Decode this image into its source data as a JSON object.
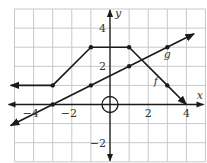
{
  "chart_data": {
    "type": "line",
    "title": "",
    "xlabel": "x",
    "ylabel": "y",
    "xlim": [
      -5,
      5
    ],
    "ylim": [
      -3,
      5
    ],
    "grid": true,
    "grid_step": 1,
    "x_ticks": [
      {
        "value": -4,
        "label": "−4"
      },
      {
        "value": -2,
        "label": "−2"
      },
      {
        "value": 2,
        "label": "2"
      },
      {
        "value": 4,
        "label": "4"
      }
    ],
    "y_ticks": [
      {
        "value": 4,
        "label": "4"
      },
      {
        "value": 2,
        "label": "2"
      },
      {
        "value": -2,
        "label": "−2"
      }
    ],
    "origin_marker": "circle",
    "series": [
      {
        "name": "f",
        "label": "f",
        "kind": "piecewise-linear",
        "points": [
          [
            -5.2,
            1
          ],
          [
            -3,
            1
          ],
          [
            -1,
            3
          ],
          [
            1,
            3
          ],
          [
            3,
            1
          ],
          [
            4,
            0
          ]
        ],
        "marked_points": [
          [
            -3,
            1
          ],
          [
            -1,
            3
          ],
          [
            1,
            3
          ],
          [
            3,
            1
          ]
        ],
        "arrow_start": true,
        "arrow_end": true,
        "label_pos": [
          2.4,
          1.0
        ]
      },
      {
        "name": "g",
        "label": "g",
        "kind": "line",
        "slope": 0.5,
        "intercept": 1.5,
        "points": [
          [
            -5.2,
            -1.1
          ],
          [
            4.4,
            3.7
          ]
        ],
        "marked_points": [
          [
            -3,
            0
          ],
          [
            -1,
            1
          ],
          [
            1,
            2
          ],
          [
            3,
            3
          ]
        ],
        "arrow_start": true,
        "arrow_end": true,
        "label_pos": [
          3.0,
          2.45
        ]
      }
    ]
  }
}
